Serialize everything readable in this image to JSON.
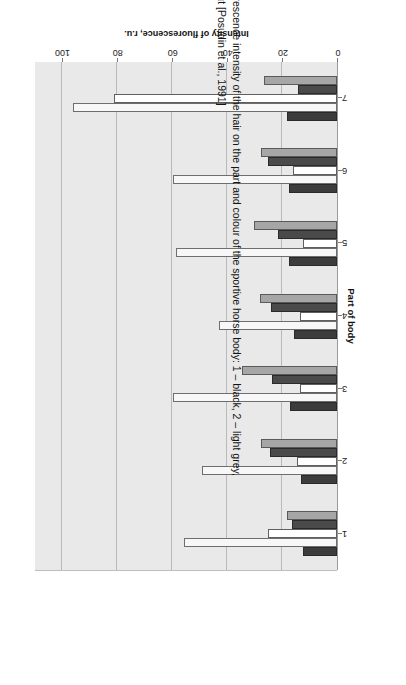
{
  "figure": {
    "number": "Fig. 7.17",
    "caption_line1": "Dependence of the fluorescence intensity of the hair on the part and colour of the sportive horse body: 1 – black, 2 – light grey,",
    "caption_line2": "3 – dark grey, 4 – bay, 5 – chestnut [Posudin et al., 1991]"
  },
  "chart_data": {
    "type": "bar",
    "orientation": "horizontal",
    "title": "",
    "xlabel": "Part of body",
    "ylabel": "Intensity of fluorescence, r.u.",
    "categories": [
      "1",
      "2",
      "3",
      "4",
      "5",
      "6",
      "7"
    ],
    "ticks": [
      "0",
      "20",
      "40",
      "60",
      "80",
      "100"
    ],
    "ylim": [
      0,
      110
    ],
    "grid": true,
    "legend": "none",
    "series": [
      {
        "name": "1 – black",
        "color": "#3c3c3c",
        "values": [
          12.5,
          13.0,
          17.0,
          15.5,
          17.5,
          17.5,
          18.0
        ]
      },
      {
        "name": "2 – light grey",
        "color": "#f7f7f7",
        "values": [
          55.5,
          49.0,
          59.5,
          43.0,
          58.5,
          59.5,
          96.0
        ]
      },
      {
        "name": "3 – dark grey",
        "color": "#ffffff",
        "values": [
          25.0,
          14.5,
          13.5,
          13.5,
          12.5,
          16.0,
          81.0
        ]
      },
      {
        "name": "4 – bay",
        "color": "#4a4a4a",
        "values": [
          16.5,
          24.5,
          23.5,
          24.0,
          21.5,
          25.0,
          14.0
        ]
      },
      {
        "name": "5 – chestnut",
        "color": "#a6a6a6",
        "values": [
          18.0,
          27.5,
          34.5,
          28.0,
          30.0,
          27.5,
          26.5
        ]
      }
    ]
  }
}
